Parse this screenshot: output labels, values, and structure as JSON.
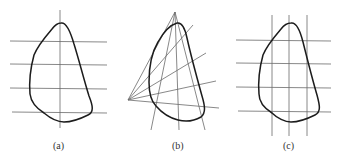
{
  "figure": {
    "panels": [
      {
        "id": "a",
        "label": "(a)",
        "description": "Closed shape crossed by four horizontal lines and one vertical line"
      },
      {
        "id": "b",
        "label": "(b)",
        "description": "Closed shape crossed by two fans of lines radiating from a top apex point and a left point"
      },
      {
        "id": "c",
        "label": "(c)",
        "description": "Closed shape crossed by four horizontal lines and three vertical lines"
      }
    ],
    "colors": {
      "outline": "#1c1c1c",
      "lines": "#6a6a6a",
      "background": "#ffffff"
    }
  }
}
